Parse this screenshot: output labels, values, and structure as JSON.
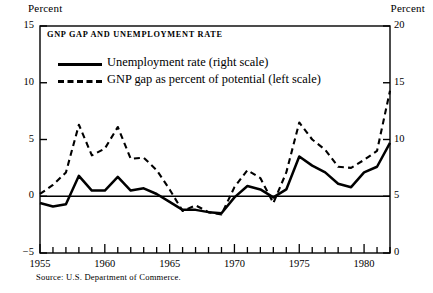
{
  "chart_data": {
    "type": "line",
    "title": "GNP GAP AND UNEMPLOYMENT RATE",
    "xlabel": "",
    "ylabel": "Percent",
    "ylabel_right": "Percent",
    "xlim": [
      1955,
      1982
    ],
    "ylim": [
      -5,
      15
    ],
    "ylim_right": [
      0,
      20
    ],
    "yticks": [
      -5,
      0,
      5,
      10,
      15
    ],
    "yticks_right": [
      0,
      5,
      10,
      15,
      20
    ],
    "xticks_labeled": [
      1955,
      1960,
      1965,
      1970,
      1975,
      1980
    ],
    "xticks_minor_interval": 1,
    "grid": false,
    "zero_reference_line": 0,
    "legend_position": "upper-left-inside",
    "source": "Source: U.S. Department of Commerce.",
    "x": [
      1955,
      1956,
      1957,
      1958,
      1959,
      1960,
      1961,
      1962,
      1963,
      1964,
      1965,
      1966,
      1967,
      1968,
      1969,
      1970,
      1971,
      1972,
      1973,
      1974,
      1975,
      1976,
      1977,
      1978,
      1979,
      1980,
      1981,
      1982
    ],
    "series": [
      {
        "name": "Unemployment rate (right scale)",
        "axis": "right",
        "style": "solid",
        "color": "#000000",
        "values": [
          4.4,
          4.1,
          4.3,
          6.8,
          5.5,
          5.5,
          6.7,
          5.5,
          5.7,
          5.2,
          4.5,
          3.8,
          3.8,
          3.6,
          3.5,
          4.9,
          5.9,
          5.6,
          4.9,
          5.6,
          8.5,
          7.7,
          7.1,
          6.1,
          5.8,
          7.1,
          7.6,
          9.7
        ]
      },
      {
        "name": "GNP gap as percent of potential (left scale)",
        "axis": "left",
        "style": "dashed",
        "color": "#000000",
        "values": [
          0.2,
          1.0,
          2.1,
          6.3,
          3.6,
          4.2,
          6.1,
          3.3,
          3.4,
          2.3,
          0.6,
          -1.3,
          -0.8,
          -1.4,
          -1.6,
          0.8,
          2.3,
          1.6,
          -0.6,
          2.1,
          6.5,
          5.0,
          4.1,
          2.6,
          2.5,
          3.2,
          4.0,
          9.3
        ]
      }
    ]
  },
  "axes_units": {
    "left": "Percent",
    "right": "Percent"
  },
  "legend": {
    "items": [
      {
        "label": "Unemployment rate (right scale)",
        "style": "solid"
      },
      {
        "label": "GNP gap as percent of potential (left scale)",
        "style": "dashed"
      }
    ]
  }
}
